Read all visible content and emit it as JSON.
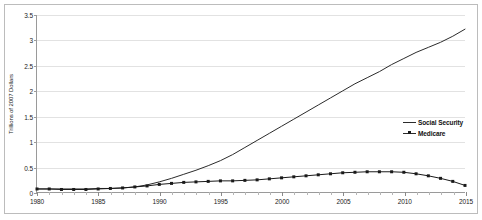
{
  "chart_data": {
    "type": "line",
    "title": "",
    "xlabel": "",
    "ylabel": "Trillions of 2007 Dollars",
    "xlim": [
      1980,
      2015
    ],
    "ylim": [
      0,
      3.5
    ],
    "grid": true,
    "legend_position": "right",
    "y_ticks": [
      "0",
      "0.5",
      "1",
      "1.5",
      "2",
      "2.5",
      "3",
      "3.5"
    ],
    "y_tick_values": [
      0,
      0.5,
      1,
      1.5,
      2,
      2.5,
      3,
      3.5
    ],
    "x_ticks": [
      "1980",
      "1985",
      "1990",
      "1995",
      "2000",
      "2005",
      "2010",
      "2015"
    ],
    "x_tick_values": [
      1980,
      1985,
      1990,
      1995,
      2000,
      2005,
      2010,
      2015
    ],
    "x": [
      1980,
      1981,
      1982,
      1983,
      1984,
      1985,
      1986,
      1987,
      1988,
      1989,
      1990,
      1991,
      1992,
      1993,
      1994,
      1995,
      1996,
      1997,
      1998,
      1999,
      2000,
      2001,
      2002,
      2003,
      2004,
      2005,
      2006,
      2007,
      2008,
      2009,
      2010,
      2011,
      2012,
      2013,
      2014,
      2015
    ],
    "series": [
      {
        "name": "Social Security",
        "marker": "none",
        "color": "#2b2b2b",
        "values": [
          0.06,
          0.06,
          0.06,
          0.06,
          0.06,
          0.07,
          0.07,
          0.08,
          0.1,
          0.14,
          0.2,
          0.27,
          0.35,
          0.43,
          0.52,
          0.62,
          0.74,
          0.88,
          1.02,
          1.16,
          1.3,
          1.44,
          1.58,
          1.72,
          1.86,
          2.0,
          2.14,
          2.26,
          2.38,
          2.52,
          2.64,
          2.76,
          2.86,
          2.96,
          3.08,
          3.22
        ]
      },
      {
        "name": "Medicare",
        "marker": "square",
        "color": "#1a1a1a",
        "values": [
          0.06,
          0.06,
          0.05,
          0.05,
          0.05,
          0.06,
          0.07,
          0.08,
          0.1,
          0.12,
          0.15,
          0.17,
          0.19,
          0.2,
          0.21,
          0.22,
          0.22,
          0.23,
          0.24,
          0.26,
          0.28,
          0.3,
          0.32,
          0.34,
          0.36,
          0.38,
          0.39,
          0.4,
          0.4,
          0.4,
          0.39,
          0.36,
          0.32,
          0.27,
          0.21,
          0.13
        ]
      }
    ]
  },
  "legend": {
    "items": [
      {
        "label": "Social Security"
      },
      {
        "label": "Medicare"
      }
    ]
  }
}
